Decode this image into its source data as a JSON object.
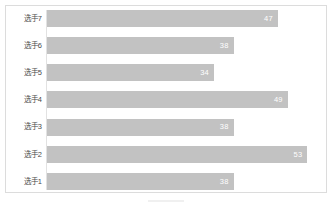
{
  "chart_data": {
    "type": "bar",
    "orientation": "horizontal",
    "title": "",
    "subtitle": "",
    "xlabel": "",
    "ylabel": "",
    "categories": [
      "选手7",
      "选手6",
      "选手5",
      "选手4",
      "选手3",
      "选手2",
      "选手1"
    ],
    "values": [
      47,
      38,
      34,
      49,
      38,
      53,
      38
    ],
    "data_labels": [
      "47",
      "38",
      "34",
      "49",
      "38",
      "53",
      "38"
    ],
    "xlim": [
      0,
      56
    ],
    "ylim": null,
    "grid": false,
    "legend": null,
    "legend_position": "none",
    "annotations": [],
    "colors": {
      "bar_fill": "#c2c2c2",
      "data_label_text": "#ffffff",
      "category_label_text": "#4a4a4a",
      "frame_border": "#dcdcdc",
      "axis_line": "#e2e2e2",
      "background": "#ffffff"
    }
  },
  "figure": {
    "frame_label": "chart-frame",
    "caption": ""
  }
}
